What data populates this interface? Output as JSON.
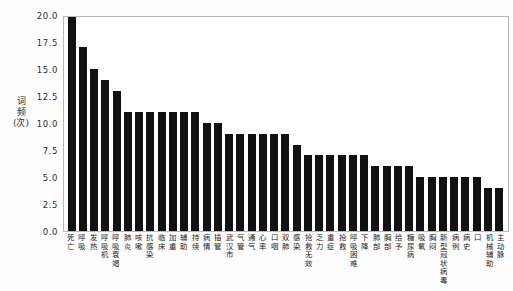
{
  "chart_data": {
    "type": "bar",
    "title": "",
    "xlabel": "",
    "ylabel": "词频(次)",
    "ylabel_lines": [
      "词",
      "频",
      "(次)"
    ],
    "ylim": [
      0.0,
      20.0
    ],
    "yticks": [
      "0.0",
      "2.5",
      "5.0",
      "7.5",
      "10.0",
      "12.5",
      "15.0",
      "17.5",
      "20.0"
    ],
    "ytick_values": [
      0.0,
      2.5,
      5.0,
      7.5,
      10.0,
      12.5,
      15.0,
      17.5,
      20.0
    ],
    "grid": false,
    "legend": "none",
    "bar_color": "#111111",
    "frame_color": "#b9b9b9",
    "background": "#ffffff",
    "categories": [
      "死亡",
      "呼吸",
      "发热",
      "呼吸机",
      "呼吸衰竭",
      "肺炎",
      "咳嗽",
      "抗感染",
      "临床",
      "加重",
      "辅助",
      "持续",
      "病情",
      "插管",
      "武汉市",
      "气管",
      "通气",
      "心率",
      "口咽",
      "双肺",
      "感染",
      "抢救无效",
      "乏力",
      "重症",
      "抢救",
      "呼吸困难",
      "下降",
      "肺部",
      "胸部",
      "给予",
      "糖尿病",
      "吸氧",
      "胸闷",
      "新型冠状病毒",
      "病例",
      "病史",
      "口",
      "机械辅助",
      "主动脉"
    ],
    "values": [
      20,
      17,
      15,
      14,
      13,
      11,
      11,
      11,
      11,
      11,
      11,
      11,
      10,
      10,
      9,
      9,
      9,
      9,
      9,
      9,
      8,
      7,
      7,
      7,
      7,
      7,
      7,
      6,
      6,
      6,
      6,
      5,
      5,
      5,
      5,
      5,
      5,
      4,
      4
    ]
  },
  "meta": {
    "chart_kind": "bar-chart"
  }
}
